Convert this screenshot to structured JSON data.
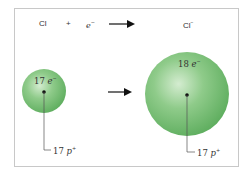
{
  "equation": {
    "reactant1": "Cl",
    "plus": "+",
    "reactant2": "e",
    "reactant2_sup": "−",
    "product": "Cl",
    "product_sup": "−"
  },
  "small_sphere": {
    "electrons_num": "17",
    "electrons_sym": "e",
    "electrons_sup": "−",
    "protons_num": "17",
    "protons_sym": "p",
    "protons_sup": "+"
  },
  "large_sphere": {
    "electrons_num": "18",
    "electrons_sym": "e",
    "electrons_sup": "−",
    "protons_num": "17",
    "protons_sym": "p",
    "protons_sup": "+"
  },
  "colors": {
    "sphere": "#7cc47c",
    "frame": "#c8c8c8"
  }
}
